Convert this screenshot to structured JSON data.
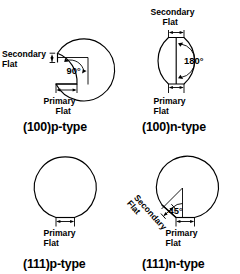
{
  "figure": {
    "background_color": "#ffffff",
    "line_color": "#000000",
    "panel_count": 4
  },
  "labels": {
    "primary_line1": "Primary",
    "primary_line2": "Flat",
    "secondary_line1": "Secondary",
    "secondary_line2": "Flat"
  },
  "panels": [
    {
      "id": "100p",
      "caption": "(100)p-type",
      "angle": "90°",
      "has_secondary_flat": true,
      "secondary_flat_position": "left",
      "primary_flat_position": "bottom",
      "secondary_label_line1": "Secondary",
      "secondary_label_line2": "Flat",
      "primary_label_line1": "Primary",
      "primary_label_line2": "Flat"
    },
    {
      "id": "100n",
      "caption": "(100)n-type",
      "angle": "180°",
      "has_secondary_flat": true,
      "secondary_flat_position": "top",
      "primary_flat_position": "bottom",
      "secondary_label_line1": "Secondary",
      "secondary_label_line2": "Flat",
      "primary_label_line1": "Primary",
      "primary_label_line2": "Flat"
    },
    {
      "id": "111p",
      "caption": "(111)p-type",
      "angle": "",
      "has_secondary_flat": false,
      "secondary_flat_position": "none",
      "primary_flat_position": "bottom",
      "secondary_label_line1": "",
      "secondary_label_line2": "",
      "primary_label_line1": "Primary",
      "primary_label_line2": "Flat"
    },
    {
      "id": "111n",
      "caption": "(111)n-type",
      "angle": "45°",
      "has_secondary_flat": true,
      "secondary_flat_position": "lower-left",
      "primary_flat_position": "bottom",
      "secondary_label_line1": "Secondary",
      "secondary_label_line2": "Flat",
      "primary_label_line1": "Primary",
      "primary_label_line2": "Flat"
    }
  ]
}
